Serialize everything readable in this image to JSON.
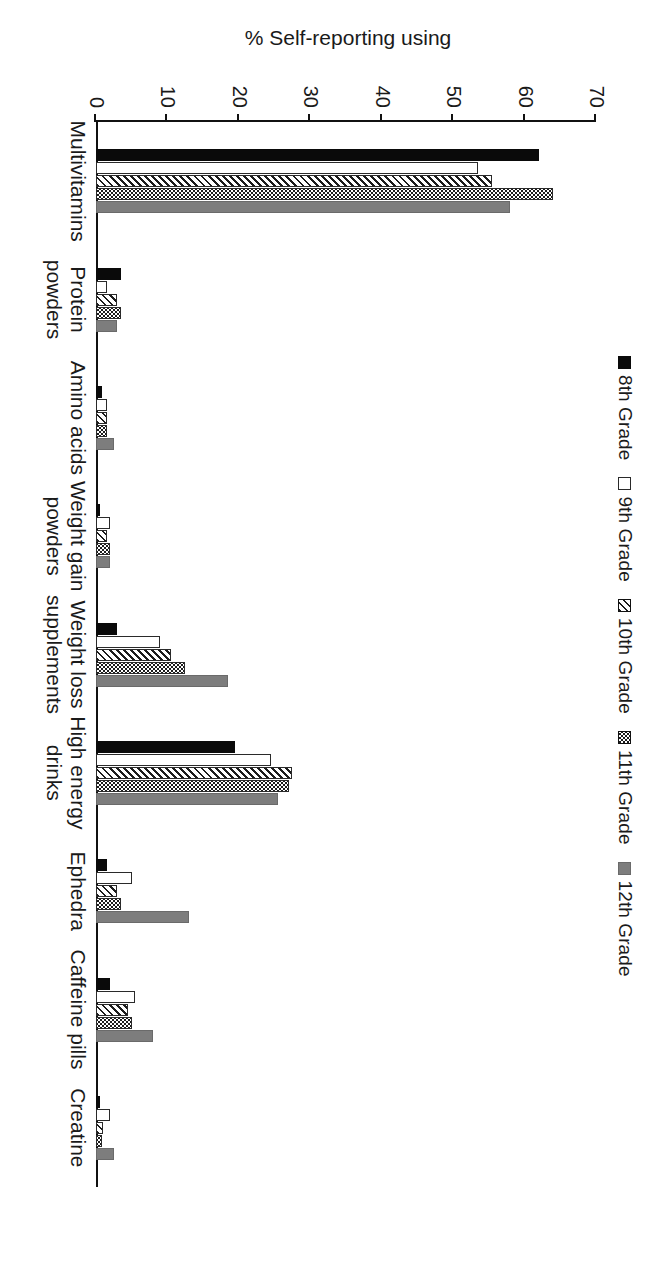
{
  "chart_data": {
    "type": "bar",
    "title": "",
    "xlabel": "",
    "ylabel": "% Self-reporting using",
    "ylim": [
      0,
      70
    ],
    "ytick_step": 10,
    "yticks": [
      "0",
      "10",
      "20",
      "30",
      "40",
      "50",
      "60",
      "70"
    ],
    "grid": false,
    "legend_position": "top",
    "orientation": "vertical-grouped-bars-rotated-90deg",
    "categories": [
      "Multivitamins",
      "Protein\npowders",
      "Amino acids",
      "Weight gain\npowders",
      "Weight loss\nsupplements",
      "High energy\ndrinks",
      "Ephedra",
      "Caffeine pills",
      "Creatine"
    ],
    "series": [
      {
        "name": "8th Grade",
        "pattern": "solid-black",
        "color": "#0a0a0a",
        "values": [
          62,
          3.5,
          0.8,
          0.6,
          3,
          19.5,
          1.5,
          2,
          0.5
        ]
      },
      {
        "name": "9th Grade",
        "pattern": "white",
        "color": "#ffffff",
        "values": [
          53.5,
          1.5,
          1.5,
          2,
          9,
          24.5,
          5,
          5.5,
          2
        ]
      },
      {
        "name": "10th Grade",
        "pattern": "diagonal-hatch",
        "color": "#1c1c1c",
        "values": [
          55.5,
          3,
          1.5,
          1.5,
          10.5,
          27.5,
          3,
          4.5,
          1
        ]
      },
      {
        "name": "11th Grade",
        "pattern": "dots",
        "color": "#1c1c1c",
        "values": [
          64,
          3.5,
          1.5,
          2,
          12.5,
          27,
          3.5,
          5,
          0.8
        ]
      },
      {
        "name": "12th Grade",
        "pattern": "solid-gray",
        "color": "#7d7d7d",
        "values": [
          58,
          3,
          2.5,
          2,
          18.5,
          25.5,
          13,
          8,
          2.5
        ]
      }
    ]
  },
  "legend": {
    "items": [
      {
        "label": "8th Grade"
      },
      {
        "label": "9th Grade"
      },
      {
        "label": "10th Grade"
      },
      {
        "label": "11th Grade"
      },
      {
        "label": "12th Grade"
      }
    ]
  }
}
